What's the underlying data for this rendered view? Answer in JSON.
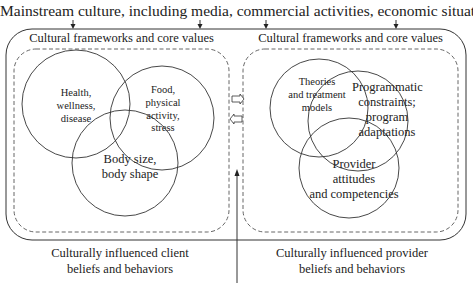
{
  "header": {
    "title": "Mainstream culture, including media, commercial activities, economic situation"
  },
  "left_panel": {
    "frame_label": "Cultural frameworks and core values",
    "circles": [
      {
        "label_lines": [
          "Health,",
          "wellness,",
          "disease"
        ]
      },
      {
        "label_lines": [
          "Food,",
          "physical",
          "activity,",
          "stress"
        ]
      },
      {
        "label_lines": [
          "Body size,",
          "body shape"
        ]
      }
    ],
    "caption_lines": [
      "Culturally influenced client",
      "beliefs and behaviors"
    ]
  },
  "right_panel": {
    "frame_label": "Cultural frameworks and core values",
    "circles": [
      {
        "label_lines": [
          "Theories",
          "and treatment",
          "models"
        ]
      },
      {
        "label_lines": [
          "Programmatic",
          "constraints;",
          "program",
          "adaptations"
        ]
      },
      {
        "label_lines": [
          "Provider",
          "attitudes",
          "and competencies"
        ]
      }
    ],
    "caption_lines": [
      "Culturally influenced provider",
      "beliefs and behaviors"
    ]
  },
  "connectors": {
    "top_arrows": 4,
    "middle_arrows": [
      "right-hollow-arrow",
      "left-hollow-arrow"
    ],
    "bottom_arrow": "up-arrow"
  },
  "colors": {
    "line": "#333333",
    "dashed": "#555555",
    "text": "#222222",
    "background": "#ffffff"
  }
}
